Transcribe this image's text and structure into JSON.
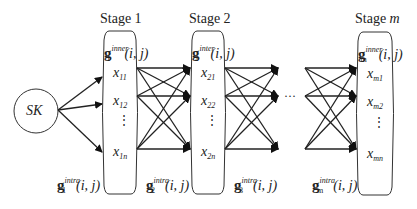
{
  "source": {
    "label": "SK"
  },
  "stages": [
    {
      "title_prefix": "Stage ",
      "title_index": "1",
      "inner_sup": "inner",
      "sub": "1",
      "args": "(i, j)",
      "nodes": [
        {
          "x": "x",
          "sub": "11"
        },
        {
          "x": "x",
          "sub": "12"
        },
        {
          "x": "x",
          "sub": "1n"
        }
      ]
    },
    {
      "title_prefix": "Stage ",
      "title_index": "2",
      "inner_sup": "inter",
      "sub": "2",
      "args": "(i, j)",
      "nodes": [
        {
          "x": "x",
          "sub": "21"
        },
        {
          "x": "x",
          "sub": "22"
        },
        {
          "x": "x",
          "sub": "2n"
        }
      ]
    },
    {
      "title_prefix": "Stage ",
      "title_index": "m",
      "inner_sup": "inner",
      "sub": "m",
      "args": "(i, j)",
      "nodes": [
        {
          "x": "x",
          "sub": "m1"
        },
        {
          "x": "x",
          "sub": "m2"
        },
        {
          "x": "x",
          "sub": "mn"
        }
      ]
    }
  ],
  "intra_labels": [
    {
      "g": "g",
      "sup": "intra",
      "sub": "1",
      "args": "(i, j)"
    },
    {
      "g": "g",
      "sup": "intra",
      "sub": "2",
      "args": "(i, j)"
    },
    {
      "g": "g",
      "sup": "intra",
      "sub": "3",
      "args": "(i, j)"
    },
    {
      "g": "g",
      "sup": "intra",
      "sub": "m",
      "args": "(i, j)"
    }
  ],
  "ellipsis": "···",
  "vdots": "⋮",
  "g_symbol": "g"
}
